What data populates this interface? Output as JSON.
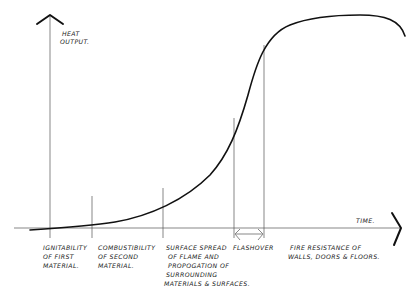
{
  "diagram": {
    "y_axis_label": [
      "HEAT",
      "OUTPUT."
    ],
    "x_axis_label": "TIME.",
    "stages": [
      {
        "id": "ignitability",
        "lines": [
          "IGNITABILITY",
          "OF FIRST",
          "MATERIAL."
        ]
      },
      {
        "id": "combustibility",
        "lines": [
          "COMBUSTIBILITY",
          "OF SECOND",
          "MATERIAL."
        ]
      },
      {
        "id": "surface-spread",
        "lines": [
          "SURFACE SPREAD",
          "OF FLAME AND",
          "PROPOGATION OF",
          "SURROUNDING",
          "MATERIALS & SURFACES."
        ]
      },
      {
        "id": "flashover",
        "lines": [
          "FLASHOVER"
        ]
      },
      {
        "id": "fire-resistance",
        "lines": [
          "FIRE RESISTANCE OF",
          "WALLS, DOORS & FLOORS."
        ]
      }
    ],
    "colors": {
      "curve": "#111111",
      "guides": "#555555",
      "text": "#222222"
    }
  }
}
